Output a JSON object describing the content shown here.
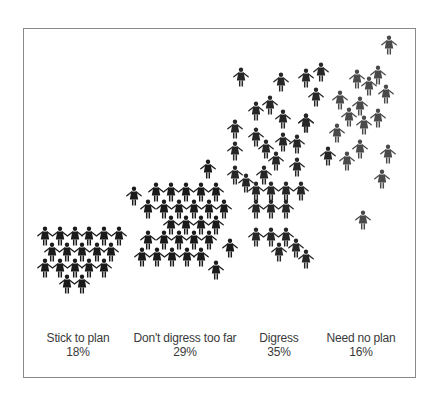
{
  "chart_data": {
    "type": "pictogram",
    "title": "",
    "xlabel": "",
    "ylabel": "",
    "categories": [
      "Stick to plan",
      "Don't digress too far",
      "Digress",
      "Need no plan"
    ],
    "values": [
      18,
      29,
      35,
      16
    ],
    "unit": "%",
    "legend": [],
    "groups": [
      {
        "label": "Stick to plan",
        "percent": "18%",
        "color": "#1a1a1a",
        "label_x": 78,
        "figures": [
          [
            45,
            237
          ],
          [
            60,
            237
          ],
          [
            75,
            237
          ],
          [
            89,
            237
          ],
          [
            104,
            237
          ],
          [
            119,
            237
          ],
          [
            52,
            253
          ],
          [
            67,
            253
          ],
          [
            82,
            253
          ],
          [
            97,
            253
          ],
          [
            111,
            253
          ],
          [
            45,
            269
          ],
          [
            60,
            269
          ],
          [
            75,
            269
          ],
          [
            89,
            269
          ],
          [
            104,
            269
          ],
          [
            67,
            285
          ],
          [
            82,
            285
          ]
        ]
      },
      {
        "label": "Don't digress too far",
        "percent": "29%",
        "color": "#1a1a1a",
        "label_x": 185,
        "figures": [
          [
            134,
            197
          ],
          [
            208,
            170
          ],
          [
            156,
            193
          ],
          [
            171,
            193
          ],
          [
            186,
            193
          ],
          [
            201,
            193
          ],
          [
            216,
            193
          ],
          [
            148,
            210
          ],
          [
            164,
            210
          ],
          [
            179,
            210
          ],
          [
            194,
            210
          ],
          [
            209,
            210
          ],
          [
            224,
            210
          ],
          [
            171,
            226
          ],
          [
            186,
            226
          ],
          [
            201,
            226
          ],
          [
            216,
            226
          ],
          [
            148,
            241
          ],
          [
            164,
            241
          ],
          [
            179,
            241
          ],
          [
            194,
            241
          ],
          [
            209,
            241
          ],
          [
            142,
            258
          ],
          [
            157,
            258
          ],
          [
            172,
            258
          ],
          [
            187,
            258
          ],
          [
            201,
            258
          ],
          [
            230,
            249
          ],
          [
            216,
            271
          ]
        ]
      },
      {
        "label": "Digress",
        "percent": "35%",
        "color": "#262626",
        "label_x": 279,
        "figures": [
          [
            241,
            78
          ],
          [
            281,
            83
          ],
          [
            306,
            79
          ],
          [
            321,
            73
          ],
          [
            256,
            112
          ],
          [
            270,
            106
          ],
          [
            283,
            120
          ],
          [
            306,
            124
          ],
          [
            235,
            130
          ],
          [
            256,
            138
          ],
          [
            266,
            150
          ],
          [
            283,
            143
          ],
          [
            297,
            145
          ],
          [
            316,
            98
          ],
          [
            235,
            152
          ],
          [
            276,
            162
          ],
          [
            297,
            168
          ],
          [
            306,
            124
          ],
          [
            328,
            157
          ],
          [
            235,
            176
          ],
          [
            246,
            184
          ],
          [
            264,
            176
          ],
          [
            256,
            192
          ],
          [
            271,
            192
          ],
          [
            286,
            192
          ],
          [
            301,
            192
          ],
          [
            256,
            210
          ],
          [
            271,
            210
          ],
          [
            286,
            210
          ],
          [
            256,
            238
          ],
          [
            271,
            238
          ],
          [
            286,
            238
          ],
          [
            279,
            253
          ],
          [
            296,
            249
          ],
          [
            306,
            260
          ]
        ]
      },
      {
        "label": "Need no plan",
        "percent": "16%",
        "color": "#4a4a4a",
        "label_x": 361,
        "figures": [
          [
            389,
            46
          ],
          [
            357,
            80
          ],
          [
            369,
            87
          ],
          [
            378,
            76
          ],
          [
            386,
            95
          ],
          [
            340,
            101
          ],
          [
            360,
            107
          ],
          [
            349,
            118
          ],
          [
            364,
            126
          ],
          [
            378,
            119
          ],
          [
            337,
            134
          ],
          [
            360,
            150
          ],
          [
            347,
            162
          ],
          [
            388,
            155
          ],
          [
            382,
            180
          ],
          [
            363,
            221
          ]
        ]
      }
    ]
  },
  "labels": [
    {
      "name": "Stick to plan",
      "value": "18%"
    },
    {
      "name": "Don't digress too far",
      "value": "29%"
    },
    {
      "name": "Digress",
      "value": "35%"
    },
    {
      "name": "Need no plan",
      "value": "16%"
    }
  ]
}
